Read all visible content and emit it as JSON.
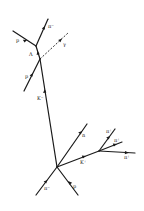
{
  "vertices": {
    "production": {
      "x": 57,
      "y": 167
    },
    "lambda_production": {
      "x": 40,
      "y": 59
    },
    "lambda_decay": {
      "x": 36,
      "y": 46
    },
    "k_plus_decay": {
      "x": 99,
      "y": 151
    }
  },
  "tracks": [
    {
      "id": "pi-minus-beam",
      "label": "π⁻",
      "x1": 36,
      "y1": 195,
      "x2": 57,
      "y2": 167,
      "style": "solid"
    },
    {
      "id": "p-target",
      "label": "p",
      "x1": 78,
      "y1": 195,
      "x2": 57,
      "y2": 167,
      "style": "solid"
    },
    {
      "id": "neutron",
      "label": "n",
      "x1": 57,
      "y1": 167,
      "x2": 87,
      "y2": 124,
      "style": "solid"
    },
    {
      "id": "k-plus",
      "label": "K⁺",
      "x1": 57,
      "y1": 167,
      "x2": 99,
      "y2": 151,
      "style": "solid"
    },
    {
      "id": "pi-plus-1",
      "label": "π⁺",
      "x1": 99,
      "y1": 151,
      "x2": 115,
      "y2": 129,
      "style": "solid"
    },
    {
      "id": "pi-plus-2",
      "label": "π⁺",
      "x1": 99,
      "y1": 151,
      "x2": 122,
      "y2": 142,
      "style": "solid"
    },
    {
      "id": "pi-plus-3",
      "label": "π⁺",
      "x1": 99,
      "y1": 151,
      "x2": 135,
      "y2": 153,
      "style": "solid"
    },
    {
      "id": "k-minus",
      "label": "K⁻",
      "x1": 57,
      "y1": 167,
      "x2": 40,
      "y2": 59,
      "style": "solid"
    },
    {
      "id": "p-recoil",
      "label": "p",
      "x1": 24,
      "y1": 91,
      "x2": 40,
      "y2": 59,
      "style": "solid"
    },
    {
      "id": "gamma",
      "label": "γ",
      "x1": 40,
      "y1": 59,
      "x2": 68,
      "y2": 33,
      "style": "dashed"
    },
    {
      "id": "lambda",
      "label": "Λ",
      "x1": 40,
      "y1": 59,
      "x2": 36,
      "y2": 46,
      "style": "solid"
    },
    {
      "id": "p-decay",
      "label": "p",
      "x1": 13,
      "y1": 31,
      "x2": 36,
      "y2": 46,
      "style": "solid"
    },
    {
      "id": "pi-minus-decay",
      "label": "π⁻",
      "x1": 36,
      "y1": 46,
      "x2": 48,
      "y2": 19,
      "style": "solid"
    }
  ],
  "labels": {
    "pi_minus_beam": "π⁻",
    "p_target": "p",
    "neutron": "n",
    "k_plus": "K⁺",
    "pi_plus_1": "π⁺",
    "pi_plus_2": "π⁺",
    "pi_plus_3": "π⁺",
    "k_minus": "K⁻",
    "p_recoil": "p",
    "gamma": "γ",
    "lambda": "Λ",
    "p_decay": "p",
    "pi_minus_decay": "π⁻"
  }
}
